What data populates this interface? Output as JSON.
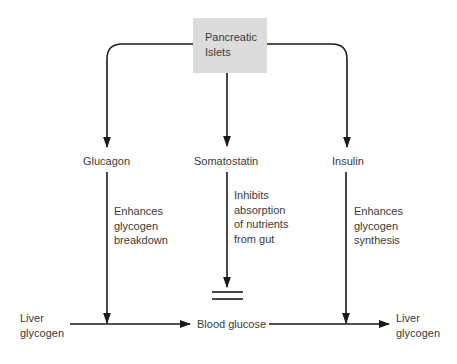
{
  "diagram": {
    "title_box": {
      "lines": [
        "Pancreatic",
        "Islets"
      ],
      "fill": "#dcdcdc"
    },
    "hormones": [
      {
        "name": "Glucagon",
        "effect": [
          "Enhances",
          "glycogen",
          "breakdown"
        ]
      },
      {
        "name": "Somatostatin",
        "effect": [
          "Inhibits",
          "absorption",
          "of nutrients",
          "from gut"
        ]
      },
      {
        "name": "Insulin",
        "effect": [
          "Enhances",
          "glycogen",
          "synthesis"
        ]
      }
    ],
    "bottom_row": {
      "left": [
        "Liver",
        "glycogen"
      ],
      "center": "Blood glucose",
      "right": [
        "Liver",
        "glycogen"
      ]
    },
    "line_color": "#1a1a1a",
    "inhibition_symbol": "double-bar"
  }
}
